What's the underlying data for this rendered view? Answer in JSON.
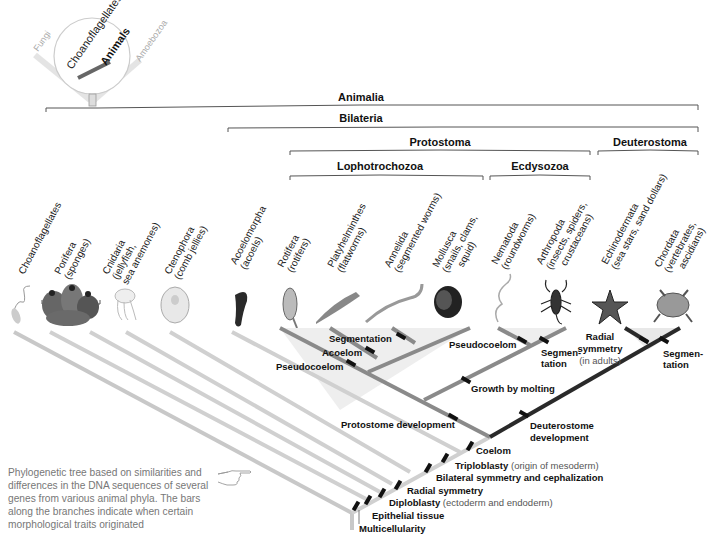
{
  "inset": {
    "labels": [
      "Fungi",
      "Choanoflagellates",
      "Animals",
      "Amoebozoa"
    ]
  },
  "clades": {
    "animalia": "Animalia",
    "bilateria": "Bilateria",
    "protostoma": "Protostoma",
    "deuterostoma": "Deuterostoma",
    "lophotrochozoa": "Lophotrochozoa",
    "ecdysozoa": "Ecdysozoa"
  },
  "taxa": [
    {
      "name": "Choanoflagellates",
      "common": ""
    },
    {
      "name": "Porifera",
      "common": "(sponges)"
    },
    {
      "name": "Cnidaria",
      "common": "(jellyfish,",
      "common2": "sea anemones)"
    },
    {
      "name": "Ctenophora",
      "common": "(comb jellies)"
    },
    {
      "name": "Acoelomorpha",
      "common": "(acoels)"
    },
    {
      "name": "Rotifera",
      "common": "(rotifers)"
    },
    {
      "name": "Platyhelminthes",
      "common": "(flatworms)"
    },
    {
      "name": "Annelida",
      "common": "(segmented worms)"
    },
    {
      "name": "Mollusca",
      "common": "(snails, clams,",
      "common2": "squid)"
    },
    {
      "name": "Nematoda",
      "common": "(roundworms)"
    },
    {
      "name": "Arthropoda",
      "common": "(insects, spiders,",
      "common2": "crustaceans)"
    },
    {
      "name": "Echinodermata",
      "common": "(sea stars, sand dollars)"
    },
    {
      "name": "Chordata",
      "common": "(vertebrates,",
      "common2": "ascidians)"
    }
  ],
  "traits": {
    "segmentation_lopho": "Segmentation",
    "acoelom": "Acoelom",
    "pseudocoelom_roti": "Pseudocoelom",
    "pseudocoelom_nema": "Pseudocoelom",
    "segmentation_arthro_1": "Segmen-",
    "segmentation_arthro_2": "tation",
    "radial_adults_1": "Radial",
    "radial_adults_2": "symmetry",
    "radial_adults_3": "(in adults)",
    "segmentation_chord_1": "Segmen-",
    "segmentation_chord_2": "tation",
    "growth_molting": "Growth by molting",
    "protostome_dev": "Protostome development",
    "deuterostome_dev_1": "Deuterostome",
    "deuterostome_dev_2": "development",
    "coelom": "Coelom",
    "triploblasty": "Triploblasty",
    "triploblasty_sub": "(origin of mesoderm)",
    "bilateral": "Bilateral symmetry and cephalization",
    "radial": "Radial symmetry",
    "diploblasty": "Diploblasty",
    "diploblasty_sub": "(ectoderm and endoderm)",
    "epithelial": "Epithelial tissue",
    "multicellularity": "Multicellularity"
  },
  "caption": "Phylogenetic tree based on similarities and differences in the DNA sequences of several genes from various animal phyla. The bars along the branches indicate when certain morphological traits originated",
  "colors": {
    "light_branch": "#c8c8c8",
    "mid_branch": "#8a8a8a",
    "dark_branch": "#2a2a2a",
    "bracket": "#555555"
  }
}
